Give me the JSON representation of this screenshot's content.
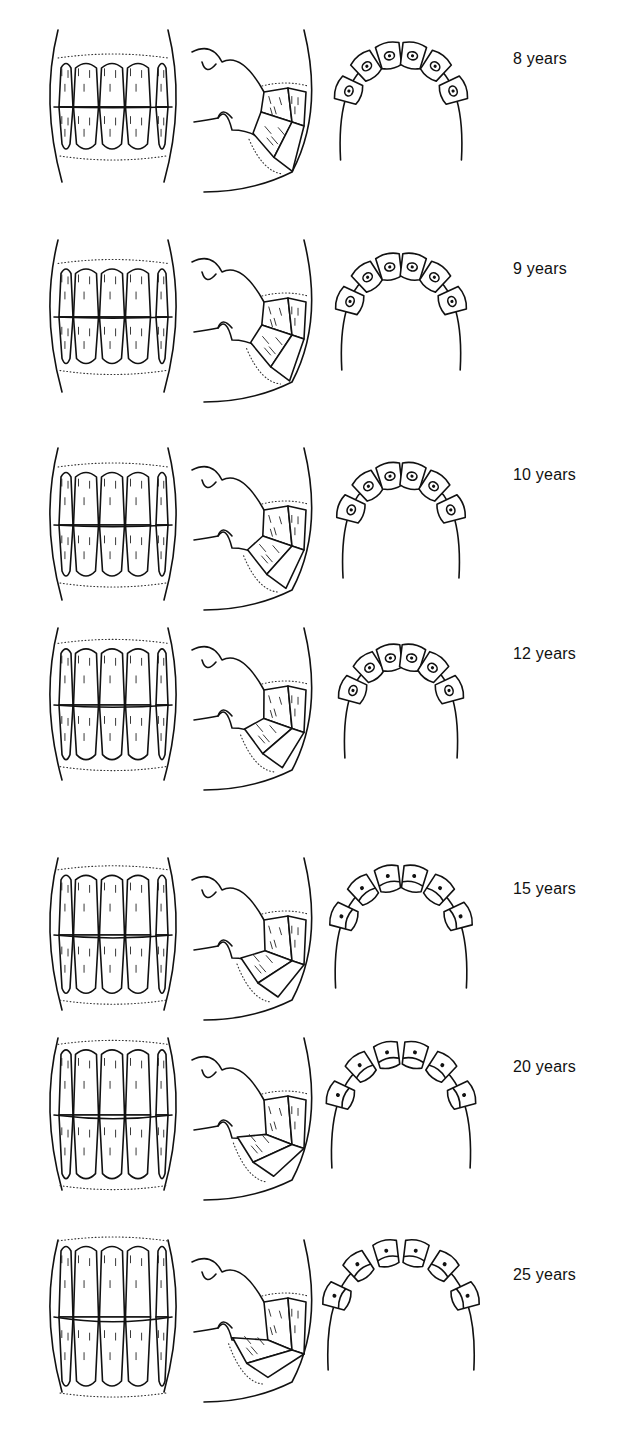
{
  "figure": {
    "views": [
      "front-view",
      "side-view",
      "occlusal-view"
    ],
    "rows": [
      {
        "label": "8 years",
        "top": 22,
        "label_top": 50,
        "tooth_h": 0.5,
        "slant": 0.1,
        "arc": 0.62,
        "mark": "cup"
      },
      {
        "label": "9 years",
        "top": 232,
        "label_top": 260,
        "tooth_h": 0.55,
        "slant": 0.18,
        "arc": 0.6,
        "mark": "cup"
      },
      {
        "label": "10 years",
        "top": 440,
        "label_top": 466,
        "tooth_h": 0.6,
        "slant": 0.28,
        "arc": 0.58,
        "mark": "cup"
      },
      {
        "label": "12 years",
        "top": 620,
        "label_top": 645,
        "tooth_h": 0.64,
        "slant": 0.38,
        "arc": 0.55,
        "mark": "cup"
      },
      {
        "label": "15 years",
        "top": 850,
        "label_top": 880,
        "tooth_h": 0.68,
        "slant": 0.5,
        "arc": 0.7,
        "mark": "dot"
      },
      {
        "label": "20 years",
        "top": 1030,
        "label_top": 1058,
        "tooth_h": 0.74,
        "slant": 0.62,
        "arc": 0.76,
        "mark": "dot"
      },
      {
        "label": "25 years",
        "top": 1232,
        "label_top": 1266,
        "tooth_h": 0.8,
        "slant": 0.78,
        "arc": 0.82,
        "mark": "dot"
      }
    ]
  },
  "colors": {
    "ink": "#111111",
    "background": "#ffffff"
  }
}
